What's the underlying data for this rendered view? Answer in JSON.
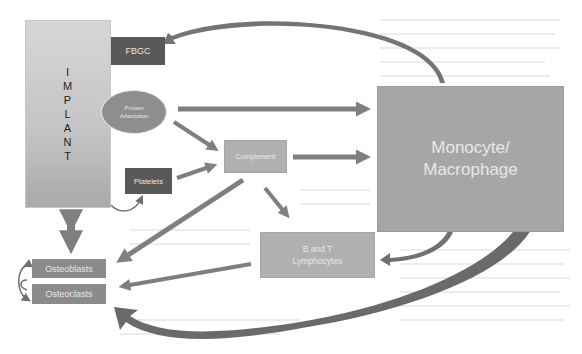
{
  "diagram": {
    "nodes": {
      "implant": {
        "label": "IMPLANT",
        "letters": [
          "I",
          "M",
          "P",
          "L",
          "A",
          "N",
          "T"
        ]
      },
      "fbgc": {
        "label": "FBGC"
      },
      "protein_adsorption": {
        "line1": "Protein",
        "line2": "Adsorption"
      },
      "platelets": {
        "label": "Platelets"
      },
      "complement": {
        "label": "Complement"
      },
      "monocyte_macrophage": {
        "line1": "Monocyte/",
        "line2": "Macrophage"
      },
      "lymphocytes": {
        "line1": "B and T",
        "line2": "Lymphocytes"
      },
      "osteoblasts": {
        "label": "Osteoblasts"
      },
      "osteoclasts": {
        "label": "Osteoclasts"
      }
    },
    "edges": [
      {
        "from": "Monocyte/Macrophage",
        "to": "FBGC",
        "style": "curved"
      },
      {
        "from": "Protein Adsorption",
        "to": "Monocyte/Macrophage",
        "style": "straight"
      },
      {
        "from": "Protein Adsorption",
        "to": "Complement",
        "style": "straight"
      },
      {
        "from": "Platelets",
        "to": "Complement",
        "style": "straight"
      },
      {
        "from": "Implant",
        "to": "Platelets",
        "style": "curved"
      },
      {
        "from": "Complement",
        "to": "Monocyte/Macrophage",
        "style": "straight"
      },
      {
        "from": "Complement",
        "to": "B and T Lymphocytes",
        "style": "straight"
      },
      {
        "from": "Complement",
        "to": "Osteoblasts",
        "style": "straight"
      },
      {
        "from": "B and T Lymphocytes",
        "to": "Osteoclasts",
        "style": "straight"
      },
      {
        "from": "Monocyte/Macrophage",
        "to": "B and T Lymphocytes",
        "style": "curved"
      },
      {
        "from": "Monocyte/Macrophage",
        "to": "Osteoclasts",
        "style": "curved"
      },
      {
        "from": "Implant",
        "to": "Osteoblasts/Osteoclasts",
        "style": "bidirectional"
      },
      {
        "from": "Osteoblasts",
        "to": "Osteoclasts",
        "style": "curved-bidirectional"
      }
    ],
    "colors": {
      "dark_box": "#595959",
      "mid_box": "#8b8b8b",
      "light_box": "#b0b0b0",
      "arrow": "#7f7f7f"
    }
  }
}
